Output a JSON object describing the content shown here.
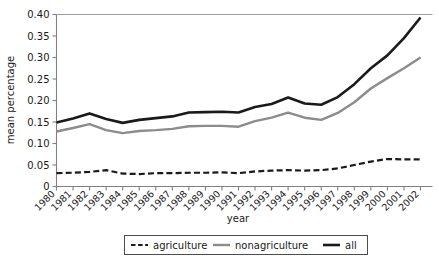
{
  "chart_data": {
    "type": "line",
    "title": "",
    "xlabel": "year",
    "ylabel": "mean percentage",
    "x": [
      1980,
      1981,
      1982,
      1983,
      1984,
      1985,
      1986,
      1987,
      1988,
      1989,
      1990,
      1991,
      1992,
      1993,
      1994,
      1995,
      1996,
      1997,
      1998,
      1999,
      2000,
      2001,
      2002
    ],
    "categories": [
      "1980",
      "1981",
      "1982",
      "1983",
      "1984",
      "1985",
      "1986",
      "1987",
      "1988",
      "1989",
      "1990",
      "1991",
      "1992",
      "1993",
      "1994",
      "1995",
      "1996",
      "1997",
      "1998",
      "1999",
      "2000",
      "2001",
      "2002"
    ],
    "xlim": [
      1980,
      2002
    ],
    "ylim": [
      0,
      0.4
    ],
    "yticks": [
      0,
      0.05,
      0.1,
      0.15,
      0.2,
      0.25,
      0.3,
      0.35,
      0.4
    ],
    "ytick_labels": [
      "0",
      "0.05",
      "0.10",
      "0.15",
      "0.20",
      "0.25",
      "0.30",
      "0.35",
      "0.40"
    ],
    "grid": false,
    "legend_position": "bottom",
    "series": [
      {
        "name": "agriculture",
        "style": "dashed",
        "color": "#1a1a1a",
        "width": 2.2,
        "values": [
          0.031,
          0.032,
          0.034,
          0.038,
          0.03,
          0.029,
          0.031,
          0.031,
          0.032,
          0.032,
          0.033,
          0.031,
          0.035,
          0.037,
          0.038,
          0.037,
          0.038,
          0.042,
          0.05,
          0.058,
          0.064,
          0.063,
          0.063
        ]
      },
      {
        "name": "nonagriculture",
        "style": "solid",
        "color": "#8c8c8c",
        "width": 2.4,
        "values": [
          0.128,
          0.136,
          0.145,
          0.131,
          0.124,
          0.129,
          0.131,
          0.134,
          0.14,
          0.141,
          0.141,
          0.139,
          0.152,
          0.16,
          0.172,
          0.16,
          0.155,
          0.171,
          0.196,
          0.228,
          0.252,
          0.275,
          0.3
        ]
      },
      {
        "name": "all",
        "style": "solid",
        "color": "#1a1a1a",
        "width": 2.6,
        "values": [
          0.149,
          0.158,
          0.17,
          0.157,
          0.148,
          0.155,
          0.159,
          0.163,
          0.172,
          0.173,
          0.174,
          0.172,
          0.185,
          0.192,
          0.207,
          0.193,
          0.19,
          0.208,
          0.238,
          0.275,
          0.305,
          0.345,
          0.393
        ]
      }
    ]
  },
  "legend": {
    "items": [
      {
        "label": "agriculture"
      },
      {
        "label": "nonagriculture"
      },
      {
        "label": "all"
      }
    ]
  }
}
